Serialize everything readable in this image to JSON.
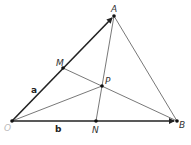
{
  "diagram": {
    "points": {
      "O": {
        "label": "O",
        "x": 12,
        "y": 121
      },
      "A": {
        "label": "A",
        "x": 114,
        "y": 16
      },
      "B": {
        "label": "B",
        "x": 177,
        "y": 121
      },
      "M": {
        "label": "M",
        "x": 63,
        "y": 68
      },
      "P": {
        "label": "P",
        "x": 102,
        "y": 86
      },
      "N": {
        "label": "N",
        "x": 96,
        "y": 121
      }
    },
    "vectors": {
      "a": {
        "label": "a",
        "from": "O",
        "to": "A"
      },
      "b": {
        "label": "b",
        "from": "O",
        "to": "B"
      }
    },
    "segments": [
      [
        "A",
        "B"
      ],
      [
        "A",
        "N"
      ],
      [
        "M",
        "B"
      ],
      [
        "O",
        "P"
      ]
    ],
    "colors": {
      "line": "#444444",
      "vector": "#222222",
      "origin_label": "#bbbbbb"
    }
  }
}
